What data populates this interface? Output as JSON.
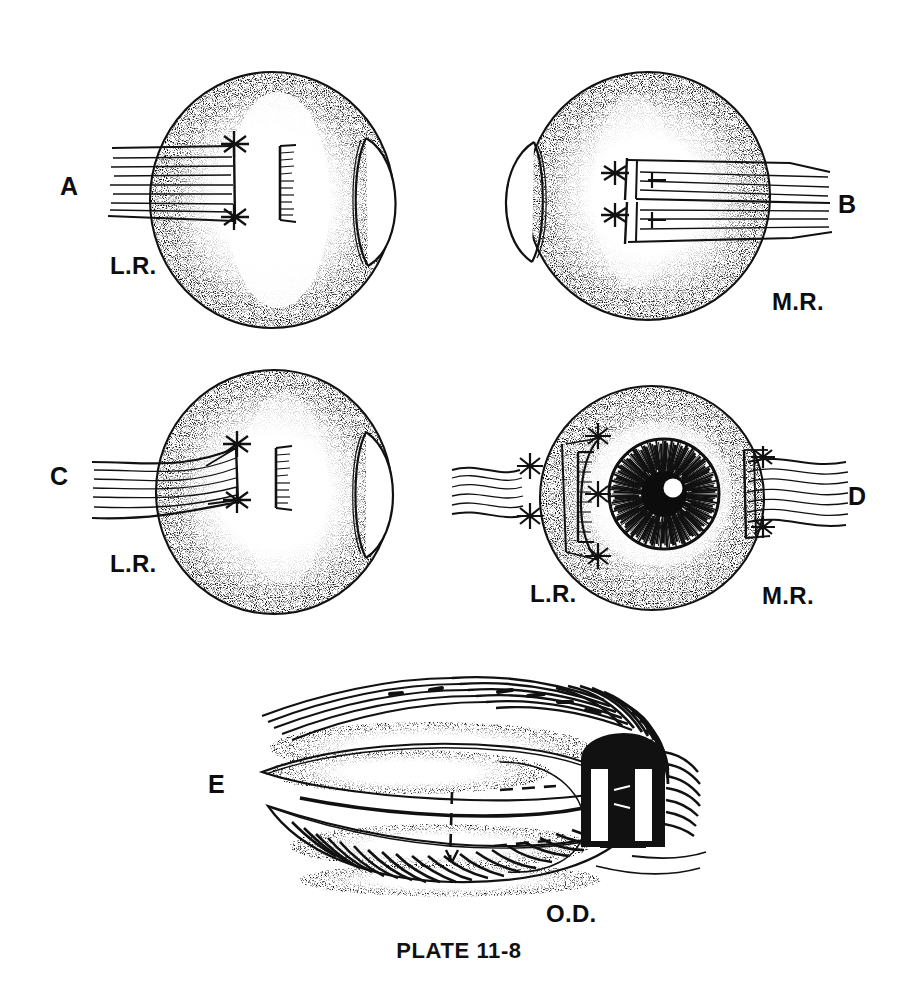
{
  "plate": {
    "caption": "PLATE 11-8",
    "background_color": "#ffffff",
    "ink_color": "#111111",
    "width": 918,
    "height": 992
  },
  "panels": [
    {
      "id": "A",
      "letter": "A",
      "letter_pos": {
        "x": 60,
        "y": 172
      },
      "view": "horizontal-section-globe-left-muscle",
      "muscle_label": "L.R.",
      "muscle_label_pos": {
        "x": 110,
        "y": 252
      },
      "globe": {
        "cx": 272,
        "cy": 200,
        "rx": 122,
        "ry": 128
      },
      "description": "Globe with lateral rectus inserted, double-armed sutures at insertion, scleral measuring mark"
    },
    {
      "id": "B",
      "letter": "B",
      "letter_pos": {
        "x": 838,
        "y": 190
      },
      "view": "horizontal-section-globe-right-muscle",
      "muscle_label": "M.R.",
      "muscle_label_pos": {
        "x": 772,
        "y": 288
      },
      "globe": {
        "cx": 642,
        "cy": 198,
        "rx": 122,
        "ry": 124
      },
      "description": "Globe with medial rectus split into two bundles, each bundle suture-tagged"
    },
    {
      "id": "C",
      "letter": "C",
      "letter_pos": {
        "x": 50,
        "y": 462
      },
      "view": "horizontal-section-globe-left-muscle-recessed",
      "muscle_label": "L.R.",
      "muscle_label_pos": {
        "x": 110,
        "y": 550
      },
      "globe": {
        "cx": 272,
        "cy": 490,
        "rx": 118,
        "ry": 122
      },
      "description": "Lateral rectus drawn forward on sutures, fan of fibers to new insertion"
    },
    {
      "id": "D",
      "letter": "D",
      "letter_pos": {
        "x": 848,
        "y": 482
      },
      "view": "frontal-globe-with-iris",
      "muscle_labels": [
        "L.R.",
        "M.R."
      ],
      "muscle_label_left_pos": {
        "x": 530,
        "y": 580
      },
      "muscle_label_right_pos": {
        "x": 762,
        "y": 582
      },
      "globe": {
        "cx": 652,
        "cy": 498,
        "r": 112
      },
      "iris": {
        "cx": 664,
        "cy": 494,
        "r": 54
      },
      "pupil": {
        "cx": 664,
        "cy": 494,
        "r": 22
      },
      "highlight": {
        "cx": 672,
        "cy": 488,
        "r": 9
      },
      "description": "Front view: stippled sclera, radially striated iris, dark pupil with white highlight, L.R. sutures left and M.R. sutures right"
    },
    {
      "id": "E",
      "letter": "E",
      "letter_pos": {
        "x": 208,
        "y": 770
      },
      "view": "closed-lids-with-lateral-speculum",
      "eye_label": "O.D.",
      "eye_label_pos": {
        "x": 546,
        "y": 900
      },
      "description": "Closed right eyelids with brow and lashes, dashed incision line, lid clamp at lateral canthus"
    }
  ]
}
